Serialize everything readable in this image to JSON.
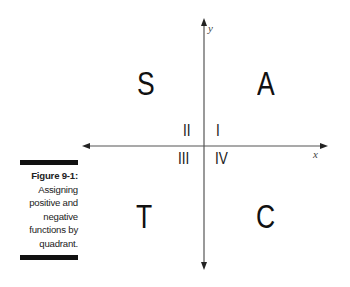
{
  "figure": {
    "caption_label": "Figure 9-1:",
    "caption_lines": [
      "Assigning",
      "positive and",
      "negative",
      "functions by",
      "quadrant."
    ]
  },
  "axes": {
    "x_label": "x",
    "y_label": "y",
    "axis_color": "#555555"
  },
  "quadrants": {
    "top_left_letter": "S",
    "top_right_letter": "A",
    "bottom_left_letter": "T",
    "bottom_right_letter": "C",
    "numeral_I": "I",
    "numeral_II": "II",
    "numeral_III": "III",
    "numeral_IV": "IV"
  }
}
